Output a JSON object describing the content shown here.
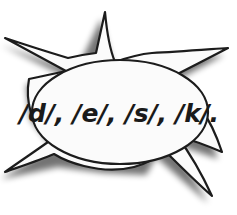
{
  "image": {
    "kind": "speech-bubble-clipart",
    "width": 237,
    "height": 215,
    "background_color": "#ffffff"
  },
  "bubble": {
    "shape": "spiky-starburst-speech-bubble",
    "fill_color": "#fbfbfb",
    "outline_color": "#1c1c1c",
    "outline_width": 2,
    "shadow_color": "#b9b9b9",
    "spike_count": 6,
    "text": "/d/, /e/, /s/, /k/.",
    "text_color": "#1a1a1a",
    "phonemes": [
      "/d/",
      "/e/",
      "/s/",
      "/k/"
    ],
    "trailing_punctuation": ".",
    "spelled_word": "desk"
  }
}
